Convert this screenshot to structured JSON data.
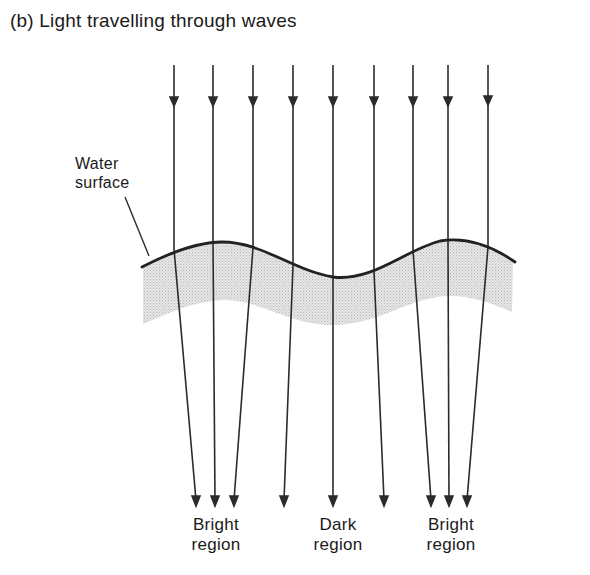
{
  "figure": {
    "title": "(b)  Light travelling through waves",
    "surface_label": {
      "line1": "Water",
      "line2": "surface"
    },
    "regions": [
      {
        "line1": "Bright",
        "line2": "region"
      },
      {
        "line1": "Dark",
        "line2": "region"
      },
      {
        "line1": "Bright",
        "line2": "region"
      }
    ],
    "colors": {
      "line": "#2b2b2b",
      "water_shade": "#d9d9d9",
      "background": "#ffffff"
    },
    "rays": [
      {
        "top_x": 174,
        "surface_y": 249,
        "bottom_x": 196
      },
      {
        "top_x": 213,
        "surface_y": 242,
        "bottom_x": 215
      },
      {
        "top_x": 253,
        "surface_y": 248,
        "bottom_x": 234
      },
      {
        "top_x": 293,
        "surface_y": 266,
        "bottom_x": 284
      },
      {
        "top_x": 333,
        "surface_y": 277,
        "bottom_x": 333
      },
      {
        "top_x": 374,
        "surface_y": 271,
        "bottom_x": 384
      },
      {
        "top_x": 413,
        "surface_y": 250,
        "bottom_x": 431
      },
      {
        "top_x": 448,
        "surface_y": 241,
        "bottom_x": 449
      },
      {
        "top_x": 488,
        "surface_y": 247,
        "bottom_x": 467
      }
    ]
  }
}
